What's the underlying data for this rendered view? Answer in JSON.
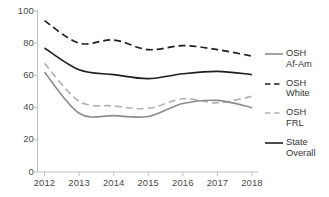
{
  "chart_data": {
    "type": "line",
    "title": "",
    "subtitle": "",
    "xlabel": "",
    "ylabel": "",
    "x": [
      "2012",
      "2013",
      "2014",
      "2015",
      "2016",
      "2017",
      "2018"
    ],
    "categories": [
      "2012",
      "2013",
      "2014",
      "2015",
      "2016",
      "2017",
      "2018"
    ],
    "xlim": [
      "2012",
      "2018"
    ],
    "ylim": [
      0,
      100
    ],
    "yticks": [
      0,
      20,
      40,
      60,
      80,
      100
    ],
    "ytick_labels": [
      "0",
      "20",
      "40",
      "60",
      "80",
      "100"
    ],
    "grid": false,
    "legend_position": "right",
    "series": [
      {
        "name": "OSH Af-Am",
        "legend_label": "OSH\nAf-Am",
        "style": "solid",
        "color": "#8c8c8c",
        "values": [
          62,
          36.5,
          35,
          34.5,
          42.5,
          44.5,
          40
        ]
      },
      {
        "name": "OSH White",
        "legend_label": "OSH\nWhite",
        "style": "dashed",
        "color": "#1f1f1f",
        "values": [
          94,
          80,
          82,
          76,
          78.5,
          76,
          72
        ]
      },
      {
        "name": "OSH FRL",
        "legend_label": "OSH\nFRL",
        "style": "dashed",
        "color": "#b3b3b3",
        "values": [
          67.5,
          44,
          41,
          39.5,
          45.5,
          43,
          47
        ]
      },
      {
        "name": "State Overall",
        "legend_label": "State\nOverall",
        "style": "solid",
        "color": "#1f1f1f",
        "values": [
          77,
          63.5,
          60.5,
          58,
          61,
          62.5,
          60.5
        ]
      }
    ]
  },
  "axis": {
    "line_color": "#bfbfbf",
    "tick_color": "#bfbfbf"
  },
  "legend": {
    "items": [
      {
        "label": "OSH\nAf-Am"
      },
      {
        "label": "OSH\nWhite"
      },
      {
        "label": "OSH\nFRL"
      },
      {
        "label": "State\nOverall"
      }
    ]
  }
}
